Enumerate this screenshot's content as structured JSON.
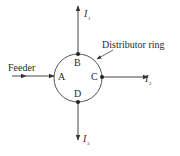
{
  "diagram": {
    "type": "distributor-ring",
    "feeder_label": "Feeder",
    "ring_label": "Distributor ring",
    "nodes": [
      {
        "id": "A",
        "label": "A"
      },
      {
        "id": "B",
        "label": "B"
      },
      {
        "id": "C",
        "label": "C"
      },
      {
        "id": "D",
        "label": "D"
      }
    ],
    "currents": [
      {
        "symbol": "I",
        "subscript": "1",
        "at": "B"
      },
      {
        "symbol": "I",
        "subscript": "2",
        "at": "C"
      },
      {
        "symbol": "I",
        "subscript": "3",
        "at": "D"
      }
    ],
    "colors": {
      "line": "#333333",
      "text": "#2a2a2a",
      "background": "#ffffff"
    }
  }
}
